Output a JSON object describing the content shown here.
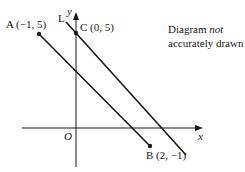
{
  "diagram": {
    "note_line1_prefix": "Diagram ",
    "note_line1_emph": "not",
    "note_line2": "accurately drawn",
    "axes": {
      "x_label": "x",
      "y_label": "y",
      "origin_label": "O"
    },
    "points": {
      "A": {
        "label": "A (−1, 5)"
      },
      "B": {
        "label": "B (2, −1)"
      },
      "C": {
        "label": "C (0, 5)"
      }
    },
    "line_L_label": "L",
    "colors": {
      "ink": "#1a1a1a",
      "background": "#ffffff"
    }
  }
}
